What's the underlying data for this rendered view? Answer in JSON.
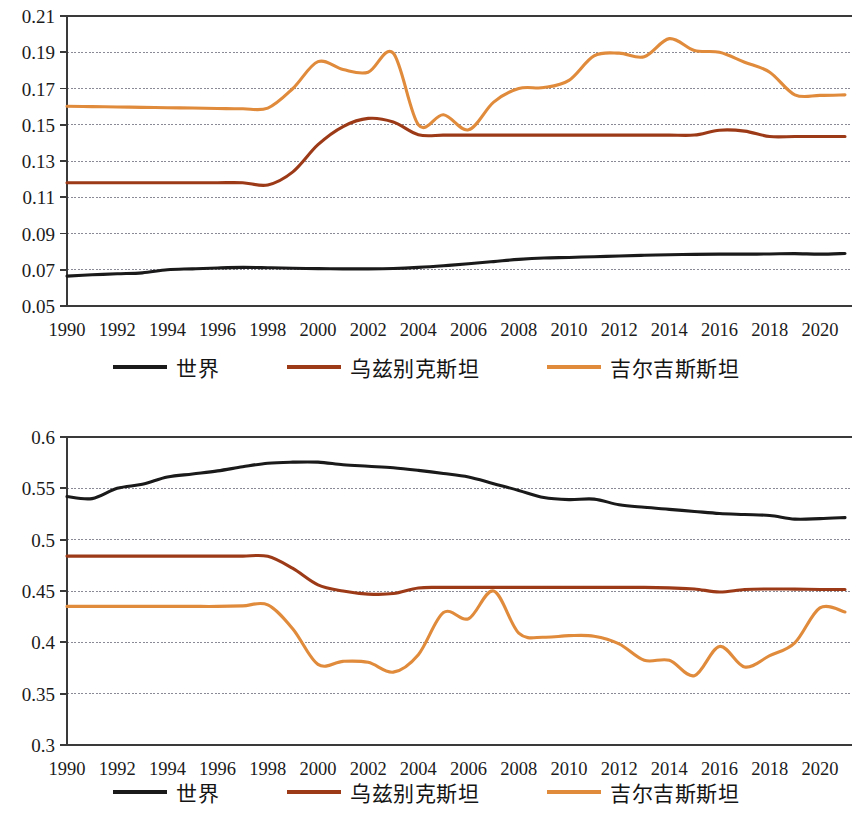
{
  "colors": {
    "world": "#1a1a1a",
    "uzbekistan": "#9c3a18",
    "kyrgyzstan": "#e08a3c",
    "axis": "#3a3a3a",
    "gridline": "#8a8a96"
  },
  "legend": {
    "items": [
      {
        "label": "世界",
        "color_key": "world"
      },
      {
        "label": "乌兹别克斯坦",
        "color_key": "uzbekistan"
      },
      {
        "label": "吉尔吉斯斯坦",
        "color_key": "kyrgyzstan"
      }
    ]
  },
  "chart_data": [
    {
      "id": "top",
      "type": "line",
      "title": "",
      "xlabel": "",
      "ylabel": "",
      "grid": true,
      "legend_position": "bottom",
      "xlim": [
        1990,
        2021
      ],
      "ylim": [
        0.05,
        0.21
      ],
      "yticks": [
        "0.05",
        "0.07",
        "0.09",
        "0.11",
        "0.13",
        "0.15",
        "0.17",
        "0.19",
        "0.21"
      ],
      "ytick_values": [
        0.05,
        0.07,
        0.09,
        0.11,
        0.13,
        0.15,
        0.17,
        0.19,
        0.21
      ],
      "xticks": [
        "1990",
        "1992",
        "1994",
        "1996",
        "1998",
        "2000",
        "2002",
        "2004",
        "2006",
        "2008",
        "2010",
        "2012",
        "2014",
        "2016",
        "2018",
        "2020"
      ],
      "xtick_values": [
        1990,
        1992,
        1994,
        1996,
        1998,
        2000,
        2002,
        2004,
        2006,
        2008,
        2010,
        2012,
        2014,
        2016,
        2018,
        2020
      ],
      "x": [
        1990,
        1991,
        1992,
        1993,
        1994,
        1995,
        1996,
        1997,
        1998,
        1999,
        2000,
        2001,
        2002,
        2003,
        2004,
        2005,
        2006,
        2007,
        2008,
        2009,
        2010,
        2011,
        2012,
        2013,
        2014,
        2015,
        2016,
        2017,
        2018,
        2019,
        2020,
        2021
      ],
      "series": [
        {
          "name": "世界",
          "color_key": "world",
          "values": [
            0.0665,
            0.0672,
            0.0678,
            0.0683,
            0.07,
            0.0705,
            0.071,
            0.0713,
            0.0711,
            0.0708,
            0.0706,
            0.0705,
            0.0705,
            0.0707,
            0.0713,
            0.0722,
            0.0733,
            0.0745,
            0.0757,
            0.0765,
            0.0768,
            0.0772,
            0.0776,
            0.078,
            0.0783,
            0.0785,
            0.0786,
            0.0786,
            0.0787,
            0.0789,
            0.0786,
            0.079
          ]
        },
        {
          "name": "乌兹别克斯坦",
          "color_key": "uzbekistan",
          "values": [
            0.118,
            0.118,
            0.118,
            0.118,
            0.118,
            0.118,
            0.118,
            0.118,
            0.1168,
            0.124,
            0.139,
            0.149,
            0.1535,
            0.1515,
            0.1445,
            0.1443,
            0.1443,
            0.1443,
            0.1443,
            0.1443,
            0.1443,
            0.1443,
            0.1443,
            0.1443,
            0.1443,
            0.1443,
            0.147,
            0.1465,
            0.1435,
            0.1435,
            0.1435,
            0.1435
          ]
        },
        {
          "name": "吉尔吉斯斯坦",
          "color_key": "kyrgyzstan",
          "values": [
            0.1602,
            0.16,
            0.1598,
            0.1596,
            0.1594,
            0.1592,
            0.159,
            0.1588,
            0.1592,
            0.17,
            0.1848,
            0.1805,
            0.179,
            0.1895,
            0.15,
            0.1555,
            0.1472,
            0.1625,
            0.17,
            0.1705,
            0.1745,
            0.188,
            0.1895,
            0.1875,
            0.1975,
            0.191,
            0.19,
            0.1845,
            0.179,
            0.1665,
            0.1662,
            0.1665
          ]
        }
      ]
    },
    {
      "id": "bottom",
      "type": "line",
      "title": "",
      "xlabel": "",
      "ylabel": "",
      "grid": true,
      "legend_position": "bottom",
      "xlim": [
        1990,
        2021
      ],
      "ylim": [
        0.3,
        0.6
      ],
      "yticks": [
        "0.3",
        "0.35",
        "0.4",
        "0.45",
        "0.5",
        "0.55",
        "0.6"
      ],
      "ytick_values": [
        0.3,
        0.35,
        0.4,
        0.45,
        0.5,
        0.55,
        0.6
      ],
      "xticks": [
        "1990",
        "1992",
        "1994",
        "1996",
        "1998",
        "2000",
        "2002",
        "2004",
        "2006",
        "2008",
        "2010",
        "2012",
        "2014",
        "2016",
        "2018",
        "2020"
      ],
      "xtick_values": [
        1990,
        1992,
        1994,
        1996,
        1998,
        2000,
        2002,
        2004,
        2006,
        2008,
        2010,
        2012,
        2014,
        2016,
        2018,
        2020
      ],
      "x": [
        1990,
        1991,
        1992,
        1993,
        1994,
        1995,
        1996,
        1997,
        1998,
        1999,
        2000,
        2001,
        2002,
        2003,
        2004,
        2005,
        2006,
        2007,
        2008,
        2009,
        2010,
        2011,
        2012,
        2013,
        2014,
        2015,
        2016,
        2017,
        2018,
        2019,
        2020,
        2021
      ],
      "series": [
        {
          "name": "世界",
          "color_key": "world",
          "values": [
            0.542,
            0.54,
            0.55,
            0.554,
            0.561,
            0.564,
            0.567,
            0.571,
            0.5745,
            0.5755,
            0.5755,
            0.573,
            0.5715,
            0.57,
            0.5675,
            0.5645,
            0.561,
            0.5545,
            0.548,
            0.541,
            0.539,
            0.5395,
            0.534,
            0.5315,
            0.5295,
            0.5275,
            0.5255,
            0.5245,
            0.5235,
            0.52,
            0.5205,
            0.5215
          ]
        },
        {
          "name": "乌兹别克斯坦",
          "color_key": "uzbekistan",
          "values": [
            0.484,
            0.484,
            0.484,
            0.484,
            0.484,
            0.484,
            0.484,
            0.484,
            0.4838,
            0.472,
            0.456,
            0.45,
            0.447,
            0.4475,
            0.453,
            0.4535,
            0.4535,
            0.4535,
            0.4535,
            0.4535,
            0.4535,
            0.4535,
            0.4535,
            0.4535,
            0.453,
            0.452,
            0.449,
            0.4515,
            0.452,
            0.4518,
            0.4515,
            0.4515
          ]
        },
        {
          "name": "吉尔吉斯斯坦",
          "color_key": "kyrgyzstan",
          "values": [
            0.435,
            0.435,
            0.435,
            0.435,
            0.435,
            0.435,
            0.435,
            0.4355,
            0.4365,
            0.413,
            0.3785,
            0.3815,
            0.3805,
            0.371,
            0.388,
            0.429,
            0.423,
            0.45,
            0.409,
            0.405,
            0.4065,
            0.406,
            0.3985,
            0.3825,
            0.3825,
            0.3675,
            0.396,
            0.376,
            0.387,
            0.3995,
            0.4335,
            0.4295
          ]
        }
      ]
    }
  ]
}
